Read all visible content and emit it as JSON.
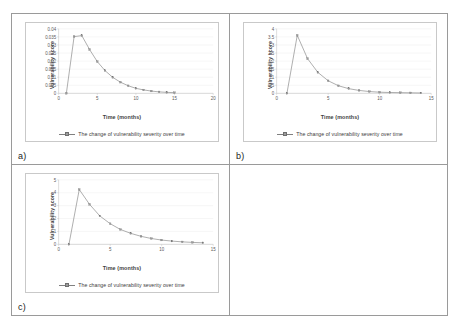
{
  "figure": {
    "layout": "2x2-table-grid",
    "background": "#ffffff",
    "border_color": "#9a9a9a",
    "series_color": "#808080",
    "marker_color": "#9c9c9c",
    "gridline_color": "#e4e4e4",
    "axis_color": "#b8b8b8"
  },
  "panels": [
    {
      "letter": "a)",
      "legend_label": "The change of vulnerability severity over time",
      "chart_data": {
        "type": "line",
        "title": "",
        "xlabel": "Time (months)",
        "ylabel": "Vulnerability score",
        "xlim": [
          0,
          20
        ],
        "ylim": [
          0,
          0.04
        ],
        "xticks": [
          0,
          5,
          10,
          15,
          20
        ],
        "yticks": [
          0,
          0.005,
          0.01,
          0.015,
          0.02,
          0.025,
          0.03,
          0.035,
          0.04
        ],
        "ytick_labels": [
          "0",
          "0.005",
          "0.01",
          "0.015",
          "0.02",
          "0.025",
          "0.03",
          "0.035",
          "0.04"
        ],
        "xtick_labels": [
          "0",
          "5",
          "10",
          "15",
          "20"
        ],
        "grid": true,
        "legend_position": "bottom",
        "x": [
          1,
          2,
          3,
          4,
          5,
          6,
          7,
          8,
          9,
          10,
          11,
          12,
          13,
          14,
          15
        ],
        "values": [
          0.0,
          0.0352,
          0.0358,
          0.0272,
          0.0197,
          0.0141,
          0.0099,
          0.0069,
          0.0047,
          0.0031,
          0.0021,
          0.0014,
          0.0009,
          0.0006,
          0.0004
        ],
        "series": [
          {
            "name": "The change of vulnerability severity over time",
            "values": [
              0.0,
              0.0352,
              0.0358,
              0.0272,
              0.0197,
              0.0141,
              0.0099,
              0.0069,
              0.0047,
              0.0031,
              0.0021,
              0.0014,
              0.0009,
              0.0006,
              0.0004
            ]
          }
        ]
      }
    },
    {
      "letter": "b)",
      "legend_label": "The change of vulnerability severity over time",
      "chart_data": {
        "type": "line",
        "title": "",
        "xlabel": "Time (months)",
        "ylabel": "Vulnerability score",
        "xlim": [
          0,
          15
        ],
        "ylim": [
          0,
          4
        ],
        "xticks": [
          0,
          5,
          10,
          15
        ],
        "yticks": [
          0,
          0.5,
          1,
          1.5,
          2,
          2.5,
          3,
          3.5,
          4
        ],
        "ytick_labels": [
          "0",
          "0.5",
          "1",
          "1.5",
          "2",
          "2.5",
          "3",
          "3.5",
          "4"
        ],
        "xtick_labels": [
          "0",
          "5",
          "10",
          "15"
        ],
        "grid": true,
        "legend_position": "bottom",
        "x": [
          1,
          2,
          3,
          4,
          5,
          6,
          7,
          8,
          9,
          10,
          11,
          12,
          13,
          14
        ],
        "values": [
          0.0,
          3.6,
          2.15,
          1.3,
          0.78,
          0.47,
          0.29,
          0.18,
          0.11,
          0.07,
          0.05,
          0.04,
          0.03,
          0.02
        ],
        "series": [
          {
            "name": "The change of vulnerability severity over time",
            "values": [
              0.0,
              3.6,
              2.15,
              1.3,
              0.78,
              0.47,
              0.29,
              0.18,
              0.11,
              0.07,
              0.05,
              0.04,
              0.03,
              0.02
            ]
          }
        ]
      }
    },
    {
      "letter": "c)",
      "legend_label": "The change of vulnerability severity over time",
      "chart_data": {
        "type": "line",
        "title": "",
        "xlabel": "Time (months)",
        "ylabel": "Vulnerability score",
        "xlim": [
          0,
          15
        ],
        "ylim": [
          0,
          5
        ],
        "xticks": [
          0,
          5,
          10,
          15
        ],
        "yticks": [
          0,
          1,
          2,
          3,
          4,
          5
        ],
        "ytick_labels": [
          "0",
          "1",
          "2",
          "3",
          "4",
          "5"
        ],
        "xtick_labels": [
          "0",
          "5",
          "10",
          "15"
        ],
        "grid": true,
        "legend_position": "bottom",
        "x": [
          1,
          2,
          3,
          4,
          5,
          6,
          7,
          8,
          9,
          10,
          11,
          12,
          13,
          14
        ],
        "values": [
          0.0,
          4.25,
          3.1,
          2.2,
          1.6,
          1.15,
          0.85,
          0.62,
          0.45,
          0.33,
          0.25,
          0.19,
          0.15,
          0.12
        ],
        "series": [
          {
            "name": "The change of vulnerability severity over time",
            "values": [
              0.0,
              4.25,
              3.1,
              2.2,
              1.6,
              1.15,
              0.85,
              0.62,
              0.45,
              0.33,
              0.25,
              0.19,
              0.15,
              0.12
            ]
          }
        ]
      }
    }
  ]
}
